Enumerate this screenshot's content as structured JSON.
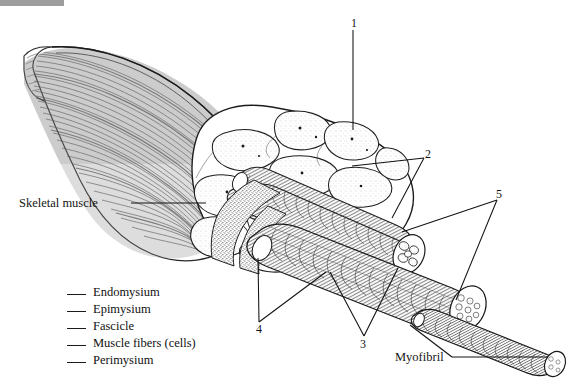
{
  "figure": {
    "kind": "anatomical-line-drawing",
    "background_color": "#ffffff",
    "ink_color": "#151515",
    "scan_artifact_color": "#9d9d9d"
  },
  "labels": {
    "skeletal_muscle": "Skeletal muscle",
    "myofibril": "Myofibril"
  },
  "callouts": [
    {
      "id": "callout-1",
      "number": "1",
      "x": 351,
      "y": 17
    },
    {
      "id": "callout-2",
      "number": "2",
      "x": 425,
      "y": 148
    },
    {
      "id": "callout-5",
      "number": "5",
      "x": 496,
      "y": 188
    },
    {
      "id": "callout-4",
      "number": "4",
      "x": 256,
      "y": 323
    },
    {
      "id": "callout-3",
      "number": "3",
      "x": 360,
      "y": 338
    }
  ],
  "legend": {
    "items": [
      {
        "blank": "___",
        "label": "Endomysium"
      },
      {
        "blank": "___",
        "label": "Epimysium"
      },
      {
        "blank": "___",
        "label": "Fascicle"
      },
      {
        "blank": "___",
        "label": "Muscle fibers (cells)"
      },
      {
        "blank": "___",
        "label": "Perimysium"
      }
    ]
  }
}
